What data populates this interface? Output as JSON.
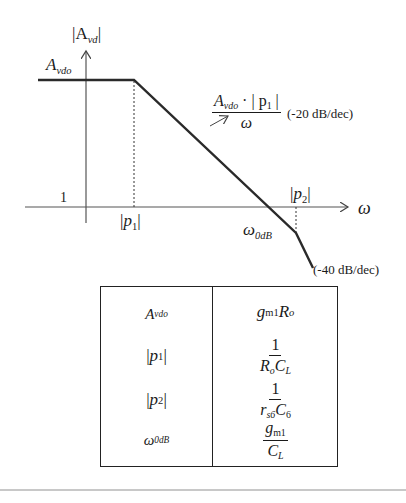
{
  "diagram": {
    "type": "bode-magnitude-asymptotic-plot",
    "y_axis_label": {
      "text": "|A",
      "sub": "vd",
      "close": "|"
    },
    "x_axis_label": "ω",
    "dc_gain_label": {
      "main": "A",
      "sub": "vdo"
    },
    "unity_label": "1",
    "pole1_label": {
      "open": "|",
      "main": "p",
      "sub": "1",
      "close": "|"
    },
    "pole2_label": {
      "open": "|",
      "main": "p",
      "sub": "2",
      "close": "|"
    },
    "crossover_label": {
      "main": "ω",
      "sub": "0dB"
    },
    "slope1_expr": {
      "num_main": "A",
      "num_sub": "vdo",
      "num_rest": " · | p",
      "num_rest_sub": "1",
      "num_close": " |",
      "den": "ω"
    },
    "slope1_text": "(-20 dB/dec)",
    "slope2_text": "(-40 dB/dec)",
    "colors": {
      "line": "#2a2a2a",
      "axis": "#555555",
      "rule": "#c8c8c8"
    }
  },
  "table": {
    "rows": [
      {
        "param": {
          "main": "A",
          "sub": "vdo"
        },
        "value": {
          "type": "inline",
          "parts": [
            {
              "m": "g",
              "s": "m1"
            },
            {
              "m": "R",
              "s": "o"
            }
          ]
        }
      },
      {
        "param": {
          "main": "|p",
          "sub": "1",
          "close": "|"
        },
        "value": {
          "type": "frac",
          "num": "1",
          "den": [
            {
              "m": "R",
              "s": "o"
            },
            {
              "m": "C",
              "s": "L"
            }
          ]
        }
      },
      {
        "param": {
          "main": "|p",
          "sub": "2",
          "close": "|"
        },
        "value": {
          "type": "frac",
          "num": "1",
          "den": [
            {
              "m": "r",
              "s": "s6"
            },
            {
              "m": "C",
              "s": "6"
            }
          ]
        }
      },
      {
        "param": {
          "main": "ω",
          "sub": "0dB"
        },
        "value": {
          "type": "frac",
          "num": [
            {
              "m": "g",
              "s": "m1"
            }
          ],
          "den": [
            {
              "m": "C",
              "s": "L"
            }
          ]
        }
      }
    ],
    "text": {
      "r0_param_main": "A",
      "r0_param_sub": "vdo",
      "r0_v_g": "g",
      "r0_v_gsub": "m1",
      "r0_v_R": "R",
      "r0_v_Rsub": "o",
      "r1_param_open": "|",
      "r1_param_main": "p",
      "r1_param_sub": "1",
      "r1_param_close": "|",
      "r1_num": "1",
      "r1_den_R": "R",
      "r1_den_Rsub": "o",
      "r1_den_C": "C",
      "r1_den_Csub": "L",
      "r2_param_open": "|",
      "r2_param_main": "p",
      "r2_param_sub": "2",
      "r2_param_close": "|",
      "r2_num": "1",
      "r2_den_r": "r",
      "r2_den_rsub": "s6",
      "r2_den_C": "C",
      "r2_den_Csub": "6",
      "r3_param_main": "ω",
      "r3_param_sub": "0dB",
      "r3_num_g": "g",
      "r3_num_gsub": "m1",
      "r3_den_C": "C",
      "r3_den_Csub": "L"
    }
  }
}
